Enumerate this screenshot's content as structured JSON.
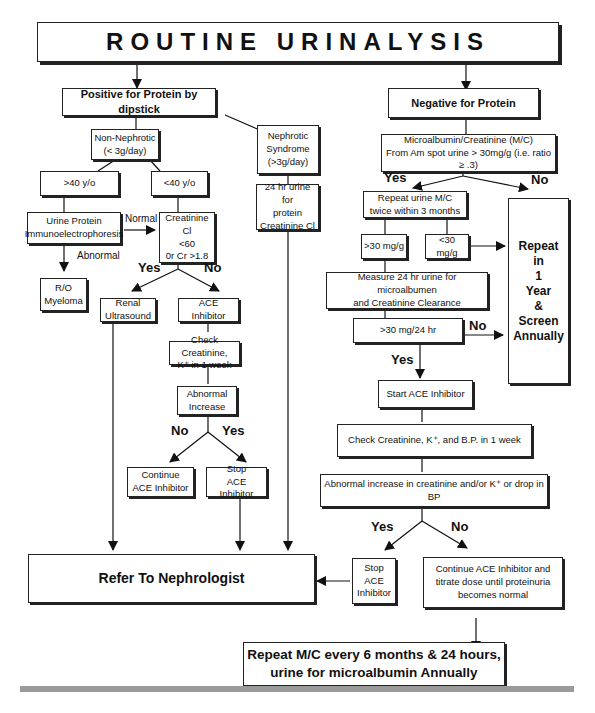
{
  "title": "ROUTINE URINALYSIS",
  "left_branch": {
    "header": "Positive for Protein by dipstick",
    "non_nephrotic": "Non-Nephrotic\n(< 3g/day)",
    "nephrotic": "Nephrotic\nSyndrome\n(>3g/day)",
    "over40": ">40 y/o",
    "under40": "<40 y/o",
    "immuno": "Urine Protein\nImmunoelectrophoresis",
    "normal_label": "Normal",
    "abnormal_label": "Abnormal",
    "myeloma": "R/O\nMyeloma",
    "creat_cl": "Creatinine Cl\n<60\n0r Cr >1.8",
    "urine24": "24 hr urine for\nprotein\nCreatinine Cl",
    "yes_label": "Yes",
    "no_label": "No",
    "renal_us": "Renal\nUltrasound",
    "ace": "ACE\nInhibitor",
    "check_creat": "Check Creatinine,\nK⁺ in 1 week",
    "abn_increase": "Abnormal\nIncrease",
    "no2_label": "No",
    "yes2_label": "Yes",
    "continue_ace": "Continue\nACE Inhibitor",
    "stop_ace": "Stop\nACE Inhibitor",
    "refer": "Refer To Nephrologist"
  },
  "right_branch": {
    "header": "Negative for Protein",
    "mc": "Microalbumin/Creatinine (M/C)\nFrom Am spot urine > 30mg/g (i.e. ratio ≥ .3)",
    "yes_label": "Yes",
    "no_label": "No",
    "repeat_mc": "Repeat urine M/C\ntwice within 3 months",
    "gt30": ">30 mg/g",
    "lt30": "<30 mg/g",
    "repeat_year": "Repeat\nin\n1\nYear\n&\nScreen\nAnnually",
    "measure24": "Measure 24 hr urine for microalbumen\nand Creatinine Clearance",
    "gt30_24": ">30 mg/24 hr",
    "no2_label": "No",
    "yes2_label": "Yes",
    "start_ace": "Start ACE Inhibitor",
    "check_bp": "Check Creatinine, K⁺, and B.P. in 1 week",
    "abn_bp": "Abnormal increase in creatinine and/or K⁺ or drop in BP",
    "yes3_label": "Yes",
    "no3_label": "No",
    "stop_ace": "Stop\nACE\nInhibitor",
    "continue_titrate": "Continue ACE Inhibitor and\ntitrate dose until proteinuria\nbecomes normal",
    "repeat_final": "Repeat M/C every 6 months & 24 hours,\nurine for microalbumin Annually"
  }
}
